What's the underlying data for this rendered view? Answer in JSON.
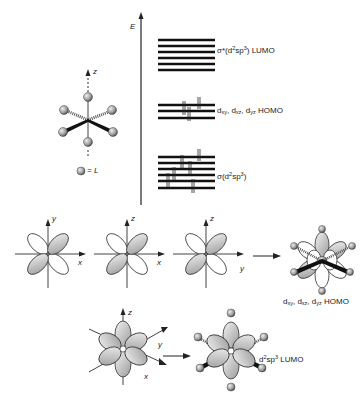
{
  "energy_axis": {
    "label": "E"
  },
  "legend": {
    "symbol": "ligand-sphere",
    "text": "= L"
  },
  "octahedron": {
    "axis_label": "z"
  },
  "levels": [
    {
      "id": "lumo",
      "count": 6,
      "label_main": "σ*(d",
      "label_sup1": "2",
      "label_mid": "sp",
      "label_sup2": "3",
      "label_end": ") LUMO",
      "filled": false
    },
    {
      "id": "homo",
      "count": 3,
      "label": "d_xy, d_xz, d_yz HOMO",
      "sub1": "xy",
      "sub2": "xz",
      "sub3": "yz",
      "suffix": "HOMO",
      "electrons": 6
    },
    {
      "id": "sigma",
      "count": 6,
      "label_main": "σ(d",
      "label_sup1": "2",
      "label_mid": "sp",
      "label_sup2": "3",
      "label_end": ")",
      "electrons": 12
    }
  ],
  "orbitals_row1": [
    {
      "name": "dxy",
      "axis_h": "x",
      "axis_v": "y"
    },
    {
      "name": "dxz",
      "axis_h": "x",
      "axis_v": "z"
    },
    {
      "name": "dyz",
      "axis_h": "y",
      "axis_v": "z"
    }
  ],
  "homo_caption": {
    "d": "d",
    "sub1": "xy",
    "sub2": "xz",
    "sub3": "yz",
    "suffix": "HOMO"
  },
  "orbitals_row2": {
    "axes": [
      "z",
      "y",
      "x"
    ]
  },
  "lumo_caption": {
    "prefix": "d",
    "sup1": "2",
    "mid": "sp",
    "sup2": "3",
    "suffix": " LUMO"
  }
}
